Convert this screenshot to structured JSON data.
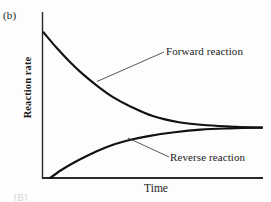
{
  "figure": {
    "panel_label": "(b)",
    "edge_fragment": "[B]"
  },
  "chart_data": {
    "type": "line",
    "title": "",
    "xlabel": "Time",
    "ylabel": "Reaction rate",
    "xlim": [
      0,
      1
    ],
    "ylim": [
      0,
      1
    ],
    "grid": false,
    "legend_position": "inline-annotations",
    "axis_ticks": {
      "x": [],
      "y": []
    },
    "series": [
      {
        "name": "Forward reaction",
        "annotation": "Forward reaction",
        "description": "Exponential decay from high initial rate to equilibrium plateau",
        "x": [
          0.0,
          0.06,
          0.12,
          0.18,
          0.25,
          0.32,
          0.4,
          0.5,
          0.62,
          0.75,
          0.88,
          1.0
        ],
        "y": [
          0.94,
          0.84,
          0.75,
          0.67,
          0.59,
          0.52,
          0.46,
          0.4,
          0.36,
          0.34,
          0.33,
          0.325
        ],
        "color": "#111111"
      },
      {
        "name": "Reverse reaction",
        "annotation": "Reverse reaction",
        "description": "Rising saturation curve from zero to the same equilibrium plateau",
        "x": [
          0.03,
          0.08,
          0.14,
          0.21,
          0.29,
          0.38,
          0.48,
          0.6,
          0.72,
          0.85,
          1.0
        ],
        "y": [
          0.0,
          0.05,
          0.1,
          0.15,
          0.2,
          0.24,
          0.27,
          0.295,
          0.312,
          0.32,
          0.325
        ],
        "color": "#111111"
      }
    ],
    "equilibrium_note": "Both curves converge to a common equilibrium rate at large time"
  }
}
